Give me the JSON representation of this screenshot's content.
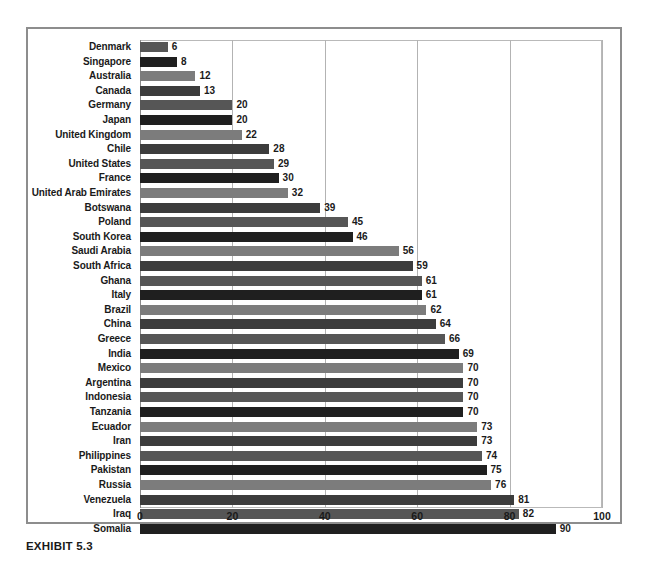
{
  "caption": "EXHIBIT 5.3",
  "chart_data": {
    "type": "bar",
    "orientation": "horizontal",
    "title": "",
    "subtitle": "",
    "xlabel": "",
    "ylabel": "",
    "xlim": [
      0,
      100
    ],
    "xticks": [
      0,
      20,
      40,
      60,
      80,
      100
    ],
    "xticklabels": [
      "0",
      "20",
      "40",
      "60",
      "80",
      "100"
    ],
    "grid": true,
    "grid_axis": "x",
    "legend": false,
    "legend_position": "none",
    "categories": [
      "Denmark",
      "Singapore",
      "Australia",
      "Canada",
      "Germany",
      "Japan",
      "United Kingdom",
      "Chile",
      "United States",
      "France",
      "United Arab Emirates",
      "Botswana",
      "Poland",
      "South Korea",
      "Saudi Arabia",
      "South Africa",
      "Ghana",
      "Italy",
      "Brazil",
      "China",
      "Greece",
      "India",
      "Mexico",
      "Argentina",
      "Indonesia",
      "Tanzania",
      "Ecuador",
      "Iran",
      "Philippines",
      "Pakistan",
      "Russia",
      "Venezuela",
      "Iraq",
      "Somalia"
    ],
    "values": [
      6,
      8,
      12,
      13,
      20,
      20,
      22,
      28,
      29,
      30,
      32,
      39,
      45,
      46,
      56,
      59,
      61,
      61,
      62,
      64,
      66,
      69,
      70,
      70,
      70,
      70,
      73,
      73,
      74,
      75,
      76,
      81,
      82,
      90
    ],
    "data_labels": [
      "6",
      "8",
      "12",
      "13",
      "20",
      "20",
      "22",
      "28",
      "29",
      "30",
      "32",
      "39",
      "45",
      "46",
      "56",
      "59",
      "61",
      "61",
      "62",
      "64",
      "66",
      "69",
      "70",
      "70",
      "70",
      "70",
      "73",
      "73",
      "74",
      "75",
      "76",
      "81",
      "82",
      "90"
    ]
  },
  "colors": {
    "bar_dark": "#1f1f1f",
    "bar_medium": "#565656",
    "bar_light": "#7c7c7c",
    "frame": "#8d8d8d",
    "gridline": "#b3b3b3",
    "text": "#1a1a1a",
    "background": "#ffffff"
  }
}
